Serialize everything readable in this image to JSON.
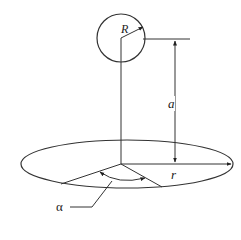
{
  "diagram": {
    "type": "geometry-figure",
    "colors": {
      "stroke": "#333333",
      "background": "#ffffff"
    },
    "labels": {
      "sphere_radius": "R",
      "height": "a",
      "disk_radius": "r",
      "angle": "α"
    },
    "elements": [
      {
        "id": "sphere",
        "shape": "circle",
        "label": "R"
      },
      {
        "id": "height-dimension",
        "shape": "double-arrow",
        "label": "a"
      },
      {
        "id": "disk",
        "shape": "ellipse",
        "label": "r"
      },
      {
        "id": "angle-arc",
        "shape": "arc-double-arrow",
        "label": "α"
      }
    ]
  }
}
